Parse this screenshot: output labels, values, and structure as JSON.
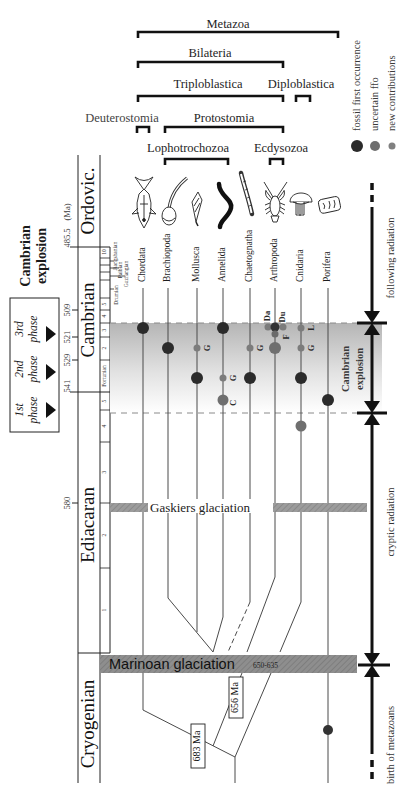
{
  "clades": {
    "metazoa": "Metazoa",
    "bilateria": "Bilateria",
    "triploblastica": "Triploblastica",
    "diploblastica": "Diploblastica",
    "deuterostomia": "Deuterostomia",
    "protostomia": "Protostomia",
    "lophotrochozoa": "Lophotrochozoa",
    "ecdysozoa": "Ecdysozoa"
  },
  "legend": [
    {
      "label": "fossil first occurrence",
      "symbol": "large-dark-dot",
      "color": "#2b2b2b"
    },
    {
      "label": "uncertain ffo",
      "symbol": "medium-gray-dot",
      "color": "#6f6f6f"
    },
    {
      "label": "new contributions",
      "symbol": "small-gray-dot",
      "color": "#808080"
    }
  ],
  "cambrian_explosion_heading": [
    "Cambrian",
    "explosion"
  ],
  "phases": [
    {
      "ordinal": "1st",
      "word": "phase"
    },
    {
      "ordinal": "2nd",
      "word": "phase"
    },
    {
      "ordinal": "3rd",
      "word": "phase"
    }
  ],
  "time_axis": {
    "unit": "(Ma)",
    "ticks": [
      "485.5",
      "509",
      "521",
      "529",
      "541",
      "580"
    ]
  },
  "periods": [
    "Ordovic.",
    "Cambrian",
    "Ediacaran",
    "Cryogenian"
  ],
  "stages": {
    "cambrian": [
      "10",
      "5",
      "4",
      "3",
      "2",
      "Fortunian"
    ],
    "cambrian_named": [
      "Jiangshanian",
      "Paibian",
      "Guzhangian",
      "Drumian"
    ],
    "ediacaran": [
      "5",
      "4",
      "3",
      "2",
      "1"
    ]
  },
  "taxa": [
    "Chordata",
    "Brachiopoda",
    "Mollusca",
    "Annelida",
    "Chaetognatha",
    "Arthropoda",
    "Cnidaria",
    "Porifera"
  ],
  "occurrences": [
    {
      "taxon": "Chordata",
      "marker": "fossil first occurrence",
      "band": "3rd phase",
      "label": ""
    },
    {
      "taxon": "Brachiopoda",
      "marker": "fossil first occurrence",
      "band": "2nd phase",
      "label": ""
    },
    {
      "taxon": "Mollusca",
      "marker": "new contributions",
      "band": "2nd phase",
      "label": "G"
    },
    {
      "taxon": "Mollusca",
      "marker": "fossil first occurrence",
      "band": "1st phase",
      "label": ""
    },
    {
      "taxon": "Annelida",
      "marker": "fossil first occurrence",
      "band": "3rd phase",
      "label": ""
    },
    {
      "taxon": "Annelida",
      "marker": "new contributions",
      "band": "1st phase",
      "label": "G"
    },
    {
      "taxon": "Annelida",
      "marker": "uncertain ffo",
      "band": "1st phase (lower)",
      "label": "C"
    },
    {
      "taxon": "Chaetognatha",
      "marker": "new contributions",
      "band": "2nd phase",
      "label": "G"
    },
    {
      "taxon": "Chaetognatha",
      "marker": "fossil first occurrence",
      "band": "1st phase",
      "label": ""
    },
    {
      "taxon": "Arthropoda",
      "marker": "new contributions",
      "band": "3rd phase",
      "label": "Da"
    },
    {
      "taxon": "Arthropoda",
      "marker": "new contributions",
      "band": "3rd phase",
      "label": "Du"
    },
    {
      "taxon": "Arthropoda",
      "marker": "fossil first occurrence",
      "band": "3rd phase",
      "label": ""
    },
    {
      "taxon": "Arthropoda",
      "marker": "new contributions",
      "band": "3rd phase",
      "label": "F"
    },
    {
      "taxon": "Arthropoda",
      "marker": "uncertain ffo",
      "band": "2nd phase",
      "label": ""
    },
    {
      "taxon": "Cnidaria",
      "marker": "new contributions",
      "band": "3rd phase",
      "label": "L"
    },
    {
      "taxon": "Cnidaria",
      "marker": "new contributions",
      "band": "2nd phase",
      "label": "G"
    },
    {
      "taxon": "Cnidaria",
      "marker": "fossil first occurrence",
      "band": "1st phase",
      "label": ""
    },
    {
      "taxon": "Cnidaria",
      "marker": "uncertain ffo",
      "band": "below Cambrian explosion",
      "label": ""
    },
    {
      "taxon": "Porifera",
      "marker": "fossil first occurrence",
      "band": "1st phase (lower)",
      "label": ""
    },
    {
      "taxon": "Porifera",
      "marker": "fossil first occurrence",
      "band": "Cryogenian",
      "label": ""
    }
  ],
  "glaciations": {
    "gaskiers": "Gaskiers glaciation",
    "marinoan": "Marinoan glaciation",
    "marinoan_range": "650-635"
  },
  "divergence_dates": [
    "683 Ma",
    "656 Ma"
  ],
  "right_axis": {
    "following": "following radiation",
    "explosion": [
      "Cambrian",
      "explosion"
    ],
    "cryptic": "cryptic radiation",
    "birth": "birth of metazoans"
  },
  "colors": {
    "ffo": "#2b2b2b",
    "uncertain": "#6f6f6f",
    "new": "#808080",
    "glaciation": "#9a9a9a",
    "explosion_band_top": "#b5b5b5"
  }
}
